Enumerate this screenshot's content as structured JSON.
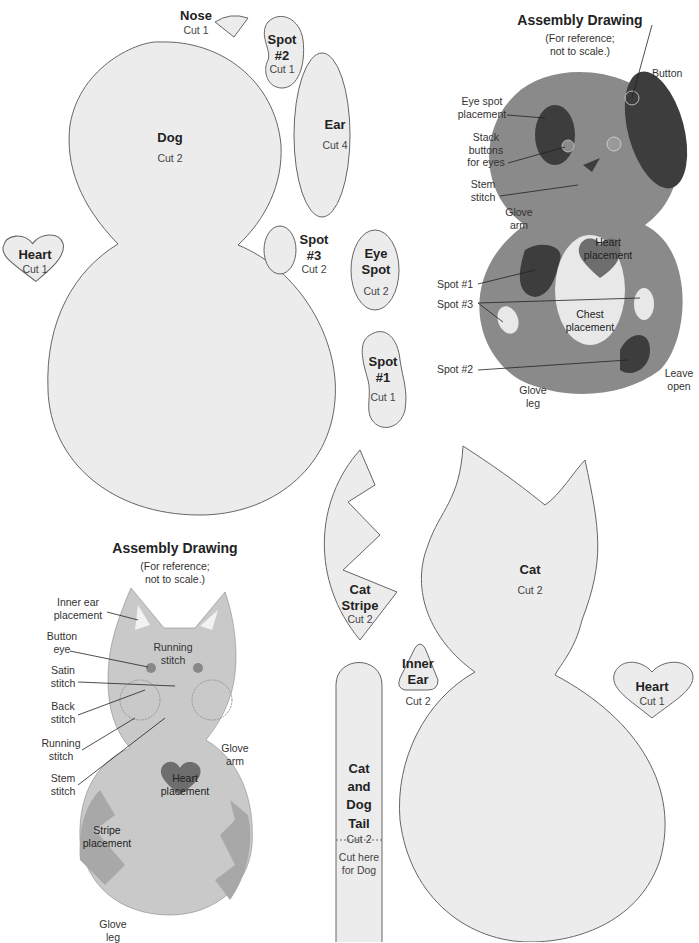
{
  "pieces": {
    "nose": {
      "title": "Nose",
      "cut": "Cut 1"
    },
    "spot2": {
      "title": "Spot #2",
      "cut": "Cut 1"
    },
    "dog": {
      "title": "Dog",
      "cut": "Cut 2"
    },
    "ear": {
      "title": "Ear",
      "cut": "Cut 4"
    },
    "heart_left": {
      "title": "Heart",
      "cut": "Cut 1"
    },
    "spot3": {
      "title": "Spot #3",
      "cut": "Cut 2"
    },
    "eye_spot": {
      "title": "Eye Spot",
      "cut": "Cut 2"
    },
    "spot1": {
      "title": "Spot #1",
      "cut": "Cut 1"
    },
    "cat_stripe": {
      "title": "Cat Stripe",
      "cut": "Cut 2"
    },
    "inner_ear": {
      "title": "Inner Ear",
      "cut": "Cut 2"
    },
    "tail": {
      "title": "Cat and Dog Tail",
      "cut": "Cut 2",
      "note": "Cut here for Dog"
    },
    "cat": {
      "title": "Cat",
      "cut": "Cut 2"
    },
    "heart_right": {
      "title": "Heart",
      "cut": "Cut 1"
    }
  },
  "dog_assembly": {
    "title": "Assembly Drawing",
    "subtitle_1": "(For reference;",
    "subtitle_2": "not to scale.)",
    "labels": {
      "button": "Button",
      "eye_spot": "Eye spot placement",
      "stack": "Stack buttons for eyes",
      "stem": "Stem stitch",
      "glove_arm": "Glove arm",
      "heart": "Heart placement",
      "spot1": "Spot #1",
      "spot3": "Spot #3",
      "chest": "Chest placement",
      "spot2": "Spot #2",
      "glove_leg": "Glove leg",
      "leave_open": "Leave open"
    },
    "colors": {
      "body": "#8a8a8a",
      "spot": "#3d3d3d",
      "heart": "#6e6e6e",
      "chest": "#e8e8e8"
    }
  },
  "cat_assembly": {
    "title": "Assembly Drawing",
    "subtitle_1": "(For reference;",
    "subtitle_2": "not to scale.)",
    "labels": {
      "inner_ear": "Inner ear placement",
      "running_top": "Running stitch",
      "button_eye": "Button eye",
      "satin": "Satin stitch",
      "back": "Back stitch",
      "running": "Running stitch",
      "stem": "Stem stitch",
      "glove_arm": "Glove arm",
      "heart": "Heart placement",
      "stripe": "Stripe placement",
      "glove_leg": "Glove leg"
    },
    "colors": {
      "body": "#c9c9c9",
      "stripe": "#a8a8a8",
      "heart": "#6e6e6e",
      "ear": "#f2f2f2"
    }
  }
}
